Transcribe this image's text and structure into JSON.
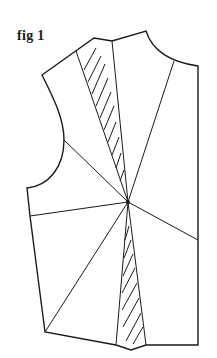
{
  "figure": {
    "label": "fig 1"
  },
  "diagram": {
    "bust_point": [
      128,
      202
    ],
    "outline_points": {
      "shoulder_left": [
        42,
        75
      ],
      "shoulder_dart_left": [
        94,
        38
      ],
      "shoulder_dart_right": [
        112,
        41
      ],
      "neck_top": [
        146,
        31
      ],
      "neck_bottom": [
        198,
        66
      ],
      "side_bottom_right": [
        198,
        345
      ],
      "waist_dart_right": [
        146,
        345
      ],
      "waist_dart_tip": [
        131,
        350
      ],
      "waist_dart_left": [
        116,
        345
      ],
      "hem_left": [
        45,
        332
      ],
      "side_waist_left": [
        30,
        216
      ],
      "armhole_bottom": [
        27,
        188
      ],
      "armhole_mid": [
        64,
        140
      ]
    },
    "slash_line_ends": [
      [
        76,
        58
      ],
      [
        174,
        73
      ],
      [
        198,
        248
      ],
      [
        30,
        216
      ],
      [
        64,
        140
      ],
      [
        45,
        332
      ]
    ],
    "darts": [
      {
        "name": "shoulder-dart",
        "hatched": true
      },
      {
        "name": "waist-dart",
        "hatched": true
      }
    ],
    "colors": {
      "line": "#1a1a1a",
      "background": "#ffffff"
    }
  }
}
